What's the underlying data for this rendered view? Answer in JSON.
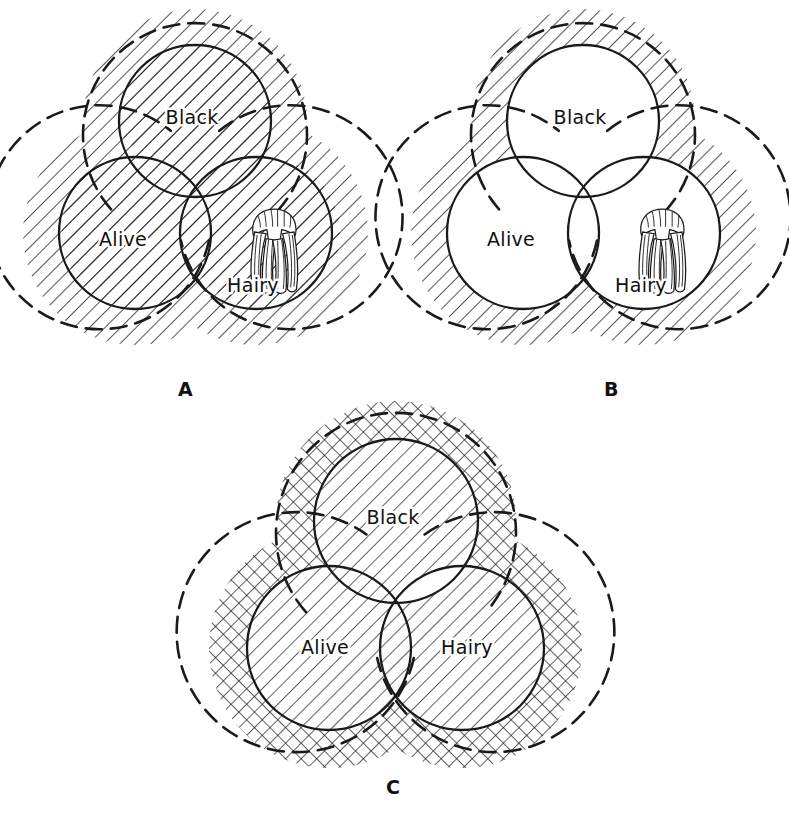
{
  "figure": {
    "background_color": "#ffffff",
    "ink_color": "#1a1a1a",
    "set_names": [
      "Black",
      "Alive",
      "Hairy"
    ],
    "illustration": "hair-wig-drawing"
  },
  "panels": [
    {
      "id": "A",
      "caption": "A",
      "shading": "all-diagonal-hatch",
      "description": "Entire universe including all three circles is diagonally hatched",
      "circles": [
        {
          "label": "Black",
          "label_x": 167,
          "label_y": 100,
          "cx": 170,
          "cy": 103,
          "r": 76,
          "shaded": true
        },
        {
          "label": "Alive",
          "label_x": 98,
          "label_y": 222,
          "cx": 110,
          "cy": 215,
          "r": 76,
          "shaded": true
        },
        {
          "label": "Hairy",
          "label_x": 228,
          "label_y": 268,
          "cx": 231,
          "cy": 215,
          "r": 76,
          "shaded": true
        }
      ],
      "outer_shaded": true,
      "hatch": "diagonal-single"
    },
    {
      "id": "B",
      "caption": "B",
      "shading": "outside-only-diagonal-hatch",
      "description": "Only the region outside all three circles is hatched; circles are blank",
      "circles": [
        {
          "label": "Black",
          "label_x": 175,
          "label_y": 100,
          "cx": 178,
          "cy": 103,
          "r": 76,
          "shaded": false
        },
        {
          "label": "Alive",
          "label_x": 106,
          "label_y": 222,
          "cx": 118,
          "cy": 215,
          "r": 76,
          "shaded": false
        },
        {
          "label": "Hairy",
          "label_x": 236,
          "label_y": 268,
          "cx": 239,
          "cy": 215,
          "r": 76,
          "shaded": false
        }
      ],
      "outer_shaded": true,
      "hatch": "diagonal-single"
    },
    {
      "id": "C",
      "caption": "C",
      "shading": "outside-crosshatch-inside-single",
      "description": "Outer region crosshatched, interiors of circles single hatched, Black-and-Hairy-only lens left blank",
      "circles": [
        {
          "label": "Black",
          "label_x": 193,
          "label_y": 110,
          "cx": 196,
          "cy": 113,
          "r": 82,
          "shaded": true
        },
        {
          "label": "Alive",
          "label_x": 125,
          "label_y": 240,
          "cx": 129,
          "cy": 240,
          "r": 82,
          "shaded": true
        },
        {
          "label": "Hairy",
          "label_x": 265,
          "label_y": 240,
          "cx": 262,
          "cy": 240,
          "r": 82,
          "shaded": true
        }
      ],
      "outer_shaded": true,
      "hatch": "diagonal-cross"
    }
  ]
}
